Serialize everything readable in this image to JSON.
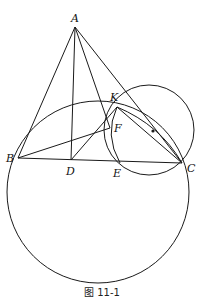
{
  "figure": {
    "caption": "图 11-1",
    "points": {
      "A": {
        "label": "A",
        "x": 75,
        "y": 27
      },
      "B": {
        "label": "B",
        "x": 18,
        "y": 158
      },
      "C": {
        "label": "C",
        "x": 182,
        "y": 163
      },
      "D": {
        "label": "D",
        "x": 70,
        "y": 160
      },
      "E": {
        "label": "E",
        "x": 120,
        "y": 163
      },
      "F": {
        "label": "F",
        "x": 110,
        "y": 128
      },
      "K": {
        "label": "K",
        "x": 117,
        "y": 107
      }
    },
    "circles": [
      {
        "name": "large-circle",
        "cx": 98,
        "cy": 192,
        "r": 91
      },
      {
        "name": "small-circle",
        "cx": 149,
        "cy": 130,
        "r": 45
      }
    ],
    "center_dot": {
      "x": 153,
      "y": 131
    },
    "segments": [
      "AB",
      "AC",
      "AD",
      "AE",
      "BC",
      "BF",
      "DK",
      "KC"
    ],
    "colors": {
      "stroke": "#1a1a1a",
      "background": "#ffffff"
    }
  }
}
